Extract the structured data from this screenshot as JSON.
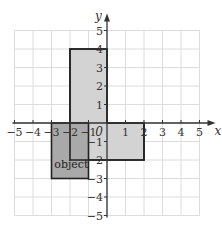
{
  "diagram": {
    "type": "coordinate-grid",
    "x_axis": {
      "label": "x",
      "min": -5,
      "max": 5,
      "ticks": [
        "-5",
        "-4",
        "-3",
        "-2",
        "-1",
        "1",
        "2",
        "3",
        "4",
        "5"
      ]
    },
    "y_axis": {
      "label": "y",
      "min": -5,
      "max": 5,
      "ticks": [
        "5",
        "4",
        "3",
        "2",
        "1",
        "-1",
        "-2",
        "-3",
        "-4",
        "-5"
      ]
    },
    "origin_label": "0",
    "shapes": [
      {
        "name": "object",
        "label": "object",
        "x1": -3,
        "y1": -3,
        "x2": -1,
        "y2": 0,
        "fill": "#a9a9a9"
      },
      {
        "name": "image-vertical",
        "label": "",
        "x1": -2,
        "y1": -2,
        "x2": 0,
        "y2": 4,
        "fill": "#d3d3d3"
      },
      {
        "name": "image-horizontal",
        "label": "",
        "x1": -2,
        "y1": -2,
        "x2": 2,
        "y2": 0,
        "fill": "#d3d3d3"
      }
    ],
    "colors": {
      "grid": "#dcdcdc",
      "axis": "#333333",
      "outline": "#222222"
    }
  }
}
